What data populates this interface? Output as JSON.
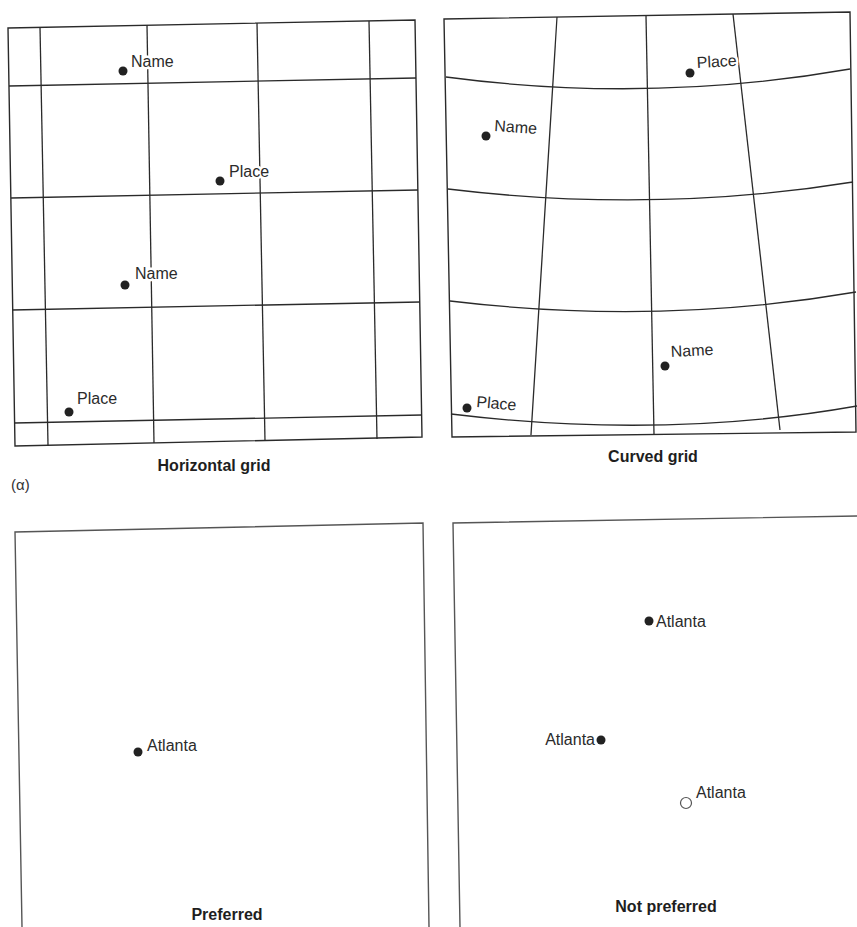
{
  "figure": {
    "part_label": "(α)",
    "colors": {
      "ink": "#2a2a2a",
      "background": "#ffffff"
    }
  },
  "panels": [
    {
      "id": "horizontal-grid",
      "caption": "Horizontal grid",
      "grid_type": "rectilinear",
      "labels": [
        {
          "text": "Name",
          "point": [
            123,
            71
          ],
          "text_pos": [
            131,
            67
          ],
          "point_style": "filled",
          "rotation": 0
        },
        {
          "text": "Place",
          "point": [
            220,
            181
          ],
          "text_pos": [
            229,
            177
          ],
          "point_style": "filled",
          "rotation": 0
        },
        {
          "text": "Name",
          "point": [
            125,
            285
          ],
          "text_pos": [
            135,
            279
          ],
          "point_style": "filled",
          "rotation": 0
        },
        {
          "text": "Place",
          "point": [
            69,
            412
          ],
          "text_pos": [
            77,
            404
          ],
          "point_style": "filled",
          "rotation": 0
        }
      ]
    },
    {
      "id": "curved-grid",
      "caption": "Curved grid",
      "grid_type": "curved",
      "labels": [
        {
          "text": "Place",
          "point": [
            690,
            73
          ],
          "text_pos": [
            697,
            68
          ],
          "point_style": "filled",
          "rotation": -3
        },
        {
          "text": "Name",
          "point": [
            486,
            136
          ],
          "text_pos": [
            494,
            131
          ],
          "point_style": "filled",
          "rotation": 4
        },
        {
          "text": "Name",
          "point": [
            665,
            366
          ],
          "text_pos": [
            671,
            357
          ],
          "point_style": "filled",
          "rotation": -3
        },
        {
          "text": "Place",
          "point": [
            467,
            408
          ],
          "text_pos": [
            476,
            407
          ],
          "point_style": "filled",
          "rotation": 5
        }
      ]
    },
    {
      "id": "preferred",
      "caption": "Preferred",
      "labels": [
        {
          "text": "Atlanta",
          "point": [
            138,
            752
          ],
          "text_pos": [
            147,
            751
          ],
          "point_style": "filled",
          "anchor": "start"
        }
      ]
    },
    {
      "id": "not-preferred",
      "caption": "Not preferred",
      "labels": [
        {
          "text": "Atlanta",
          "point": [
            649,
            621
          ],
          "text_pos": [
            656,
            627
          ],
          "point_style": "filled",
          "anchor": "start"
        },
        {
          "text": "Atlanta",
          "point": [
            601,
            740
          ],
          "text_pos": [
            595,
            745
          ],
          "point_style": "filled",
          "anchor": "end"
        },
        {
          "text": "Atlanta",
          "point": [
            686,
            803
          ],
          "text_pos": [
            696,
            798
          ],
          "point_style": "hollow",
          "anchor": "start"
        }
      ]
    }
  ]
}
